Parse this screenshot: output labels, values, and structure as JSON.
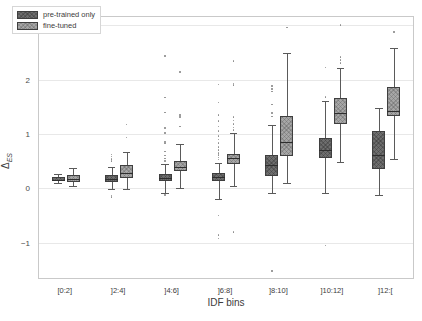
{
  "chart_data": {
    "type": "box",
    "title": "",
    "xlabel": "IDF bins",
    "ylabel": "Δ",
    "ylabel_sub": "ES",
    "ylim": [
      -1.65,
      3.15
    ],
    "yticks": [
      -1,
      0,
      1,
      2,
      3
    ],
    "ytick_labels": [
      "−1",
      "0",
      "1",
      "2",
      "3"
    ],
    "grid": true,
    "legend_position": "upper left",
    "categories": [
      "[0:2]",
      "]2:4]",
      "]4:6]",
      "]6:8]",
      "]8:10]",
      "]10:12]",
      "]12:["
    ],
    "colors": {
      "pre_trained_only": "#6e6e6e",
      "fine_tuned": "#a6a6a6",
      "line": "#5a5a5a",
      "grid": "#e8e8e8"
    },
    "series": [
      {
        "name": "pre-trained only",
        "color": "#6e6e6e",
        "boxes": [
          {
            "category": "[0:2]",
            "whisker_low": 0.09,
            "q1": 0.13,
            "median": 0.16,
            "q3": 0.2,
            "whisker_high": 0.26,
            "fliers": []
          },
          {
            "category": "]2:4]",
            "whisker_low": -0.02,
            "q1": 0.11,
            "median": 0.17,
            "q3": 0.24,
            "whisker_high": 0.4,
            "fliers": [
              0.62,
              0.58,
              0.54,
              0.5,
              -0.13,
              -0.16
            ]
          },
          {
            "category": "]4:6]",
            "whisker_low": -0.09,
            "q1": 0.13,
            "median": 0.19,
            "q3": 0.27,
            "whisker_high": 0.45,
            "fliers": [
              1.39,
              1.11,
              1.02,
              0.85,
              0.82,
              0.68,
              0.6,
              0.55,
              0.5,
              1.67,
              2.43,
              -0.12
            ]
          },
          {
            "category": "]6:8]",
            "whisker_low": -0.19,
            "q1": 0.13,
            "median": 0.2,
            "q3": 0.28,
            "whisker_high": 0.47,
            "fliers": [
              1.91,
              1.58,
              1.35,
              1.24,
              1.14,
              1.05,
              0.96,
              0.9,
              0.83,
              0.76,
              0.7,
              0.65,
              0.61,
              0.57,
              0.53,
              -0.5,
              -0.86,
              -0.92
            ]
          },
          {
            "category": "]8:10]",
            "whisker_low": -0.08,
            "q1": 0.22,
            "median": 0.43,
            "q3": 0.61,
            "whisker_high": 1.17,
            "fliers": [
              1.88,
              1.83,
              1.78,
              1.54,
              1.38,
              1.32,
              -1.52
            ]
          },
          {
            "category": "]10:12]",
            "whisker_low": -0.08,
            "q1": 0.55,
            "median": 0.71,
            "q3": 0.93,
            "whisker_high": 1.6,
            "fliers": [
              2.22,
              1.68,
              -1.05
            ]
          },
          {
            "category": "]12:[",
            "whisker_low": -0.13,
            "q1": 0.36,
            "median": 0.61,
            "q3": 1.05,
            "whisker_high": 1.47,
            "fliers": []
          }
        ]
      },
      {
        "name": "fine-tuned",
        "color": "#a6a6a6",
        "boxes": [
          {
            "category": "[0:2]",
            "whisker_low": 0.05,
            "q1": 0.12,
            "median": 0.17,
            "q3": 0.24,
            "whisker_high": 0.37,
            "fliers": []
          },
          {
            "category": "]2:4]",
            "whisker_low": -0.01,
            "q1": 0.18,
            "median": 0.28,
            "q3": 0.42,
            "whisker_high": 0.66,
            "fliers": [
              1.17,
              0.93
            ]
          },
          {
            "category": "]4:6]",
            "whisker_low": 0.01,
            "q1": 0.32,
            "median": 0.4,
            "q3": 0.5,
            "whisker_high": 0.81,
            "fliers": [
              2.14,
              1.35,
              1.31,
              1.14
            ]
          },
          {
            "category": "]6:8]",
            "whisker_low": 0.05,
            "q1": 0.45,
            "median": 0.55,
            "q3": 0.63,
            "whisker_high": 1.01,
            "fliers": [
              2.34,
              1.93,
              1.9,
              1.31,
              1.25,
              1.18,
              1.12,
              1.07,
              -0.8
            ]
          },
          {
            "category": "]8:10]",
            "whisker_low": 0.09,
            "q1": 0.6,
            "median": 0.86,
            "q3": 1.33,
            "whisker_high": 2.48,
            "fliers": [
              2.96
            ]
          },
          {
            "category": "]10:12]",
            "whisker_low": 0.49,
            "q1": 1.19,
            "median": 1.38,
            "q3": 1.66,
            "whisker_high": 2.22,
            "fliers": [
              3.0,
              2.41,
              2.36,
              2.3
            ]
          },
          {
            "category": "]12:[",
            "whisker_low": 0.54,
            "q1": 1.33,
            "median": 1.42,
            "q3": 1.86,
            "whisker_high": 2.58,
            "fliers": [
              2.87
            ]
          }
        ]
      }
    ]
  }
}
